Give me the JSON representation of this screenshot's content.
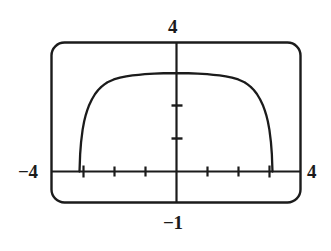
{
  "figure": {
    "kind": "graphing-calculator-viewport",
    "title": "",
    "labels": {
      "ymax": "4",
      "ymin": "−1",
      "xmin": "−4",
      "xmax": "4"
    },
    "colors": {
      "ink": "#1b1b1b",
      "background": "#ffffff",
      "curve": "#1b1b1b",
      "axis": "#1b1b1b",
      "frame": "#1b1b1b"
    }
  },
  "chart_data": {
    "type": "line",
    "title": "",
    "xlabel": "",
    "ylabel": "",
    "xlim": [
      -4,
      4
    ],
    "ylim": [
      -1,
      4
    ],
    "grid": false,
    "legend": "none",
    "axis_ticks": {
      "x": [
        -3,
        -2,
        -1,
        1,
        2,
        3
      ],
      "y": [
        1,
        2
      ],
      "x_tick_spacing": 1,
      "y_tick_spacing": 1
    },
    "annotations": [
      {
        "text": "4",
        "position": "top",
        "meaning": "Ymax"
      },
      {
        "text": "−1",
        "position": "bottom",
        "meaning": "Ymin"
      },
      {
        "text": "−4",
        "position": "left",
        "meaning": "Xmin"
      },
      {
        "text": "4",
        "position": "right",
        "meaning": "Xmax"
      }
    ],
    "series": [
      {
        "name": "curve",
        "x": [
          -3.1,
          -3.08,
          -3.05,
          -3.0,
          -2.95,
          -2.9,
          -2.85,
          -2.8,
          -2.7,
          -2.6,
          -2.5,
          -2.4,
          -2.3,
          -2.2,
          -2.0,
          -1.8,
          -1.6,
          -1.4,
          -1.2,
          -1.0,
          -0.7,
          -0.4,
          0.0,
          0.4,
          0.7,
          1.0,
          1.2,
          1.4,
          1.6,
          1.8,
          2.0,
          2.2,
          2.3,
          2.4,
          2.5,
          2.6,
          2.7,
          2.8,
          2.85,
          2.9,
          2.95,
          3.0,
          3.05,
          3.08,
          3.1
        ],
        "y": [
          0.0,
          0.55,
          0.95,
          1.35,
          1.62,
          1.82,
          1.98,
          2.12,
          2.33,
          2.5,
          2.63,
          2.73,
          2.81,
          2.88,
          2.97,
          3.03,
          3.07,
          3.1,
          3.12,
          3.14,
          3.16,
          3.17,
          3.17,
          3.17,
          3.16,
          3.14,
          3.12,
          3.1,
          3.07,
          3.03,
          2.97,
          2.88,
          2.81,
          2.73,
          2.63,
          2.5,
          2.33,
          2.12,
          1.98,
          1.82,
          1.62,
          1.35,
          0.95,
          0.55,
          0.0
        ]
      }
    ]
  }
}
